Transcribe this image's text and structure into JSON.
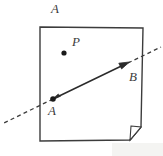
{
  "figure": {
    "type": "geometry-diagram",
    "background_color": "#ffffff",
    "stroke_color": "#3c3c3c",
    "dot_color": "#1a1a1a",
    "labels": {
      "plane": "A",
      "point_p": "P",
      "point_a": "A",
      "point_b": "B"
    },
    "geometry": {
      "plane_outline": [
        [
          40,
          27
        ],
        [
          143,
          28
        ],
        [
          141,
          127
        ],
        [
          130,
          140
        ],
        [
          40,
          141
        ]
      ],
      "fold_corner": [
        [
          141,
          127
        ],
        [
          130,
          140
        ]
      ],
      "points": {
        "P": [
          64,
          53
        ],
        "A": [
          53,
          99
        ],
        "B": [
          128,
          63
        ]
      },
      "solid_segment": [
        [
          53,
          99
        ],
        [
          128,
          63
        ]
      ],
      "dashed_left_extension": [
        [
          53,
          99
        ],
        [
          2,
          124
        ]
      ],
      "dashed_right_extension": [
        [
          128,
          63
        ],
        [
          161,
          47
        ]
      ],
      "arrow_heads": [
        "B-end",
        "A-end"
      ]
    }
  }
}
